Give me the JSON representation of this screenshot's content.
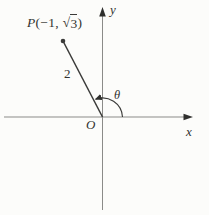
{
  "figure": {
    "background": "#fcfcfa",
    "colors": {
      "axis": "#8b8b88",
      "line": "#3a3a38",
      "arrow": "#2f2f2d"
    },
    "labels": {
      "point": {
        "p": "P",
        "open": "(−1, ",
        "sqrt": "√",
        "radicand": "3",
        "close": ")"
      },
      "segment_length": "2",
      "angle": "θ",
      "origin": "O",
      "x_axis": "x",
      "y_axis": "y"
    }
  }
}
